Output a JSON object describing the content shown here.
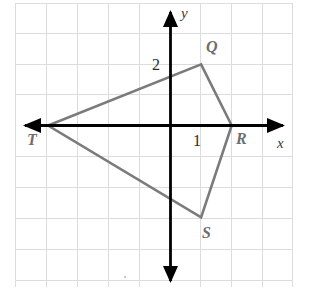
{
  "figure": {
    "kind": "coordinate-plane-quadrilateral",
    "axis_labels": {
      "x": "x",
      "y": "y"
    },
    "tick_labels": {
      "x_one": "1",
      "y_two": "2"
    },
    "vertex_labels": {
      "Q": "Q",
      "R": "R",
      "S": "S",
      "T": "T"
    },
    "colors": {
      "background": "#ffffff",
      "grid": "#dcdcdc",
      "axis": "#000000",
      "shape_stroke": "#7b7b7b",
      "label_text": "#6e6e6e",
      "tick_text": "#2b2b2b"
    }
  },
  "chart_data": {
    "type": "scatter",
    "title": "",
    "xlabel": "x",
    "ylabel": "y",
    "xlim": [
      -5,
      4
    ],
    "ylim": [
      -5,
      4
    ],
    "grid": true,
    "grid_step": 1,
    "legend": "none",
    "x_ticks_labeled": [
      {
        "value": 1,
        "label": "1"
      }
    ],
    "y_ticks_labeled": [
      {
        "value": 2,
        "label": "2"
      }
    ],
    "series": [
      {
        "name": "Quadrilateral QRST",
        "kind": "closed-polygon",
        "points": [
          {
            "label": "Q",
            "x": 1,
            "y": 2
          },
          {
            "label": "R",
            "x": 2,
            "y": 0
          },
          {
            "label": "S",
            "x": 1,
            "y": -3
          },
          {
            "label": "T",
            "x": -4,
            "y": 0
          }
        ],
        "edges": [
          "Q-R",
          "R-S",
          "S-T",
          "T-Q"
        ]
      }
    ],
    "annotations": [
      {
        "text": "Q",
        "x": 1.35,
        "y": 2.5
      },
      {
        "text": "R",
        "x": 2.2,
        "y": -0.55
      },
      {
        "text": "S",
        "x": 1.25,
        "y": -3.55
      },
      {
        "text": "T",
        "x": -4.35,
        "y": -0.6
      },
      {
        "text": "2",
        "x": -0.42,
        "y": 2.0
      },
      {
        "text": "1",
        "x": 0.77,
        "y": -0.55
      }
    ]
  }
}
